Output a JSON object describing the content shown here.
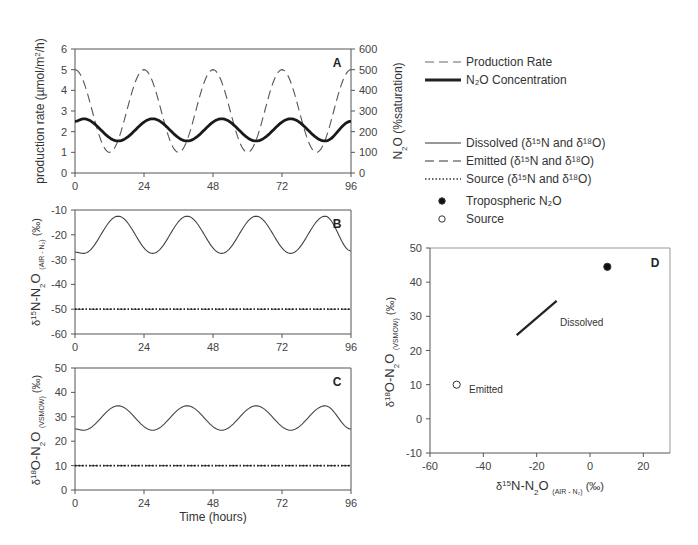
{
  "chart_data": [
    {
      "panel": "A",
      "type": "line",
      "xlabel": "",
      "ylabel": "production rate (µmol/m²/h)",
      "ylabel_right": "N₂O (%saturation)",
      "xlim": [
        0,
        96
      ],
      "ylim": [
        0,
        6
      ],
      "ylim_right": [
        0,
        600
      ],
      "xticks": [
        0,
        24,
        48,
        72,
        96
      ],
      "yticks": [
        0,
        1,
        2,
        3,
        4,
        5,
        6
      ],
      "yticks_right": [
        0,
        100,
        200,
        300,
        400,
        500,
        600
      ],
      "series": [
        {
          "name": "Production Rate",
          "style": "dashed",
          "axis": "left",
          "x": [
            0,
            12,
            24,
            36,
            48,
            60,
            72,
            84,
            96
          ],
          "values": [
            5,
            1,
            5,
            1,
            5,
            1,
            5,
            1,
            5
          ]
        },
        {
          "name": "N2O Concentration",
          "style": "solid-thick",
          "axis": "left",
          "x": [
            0,
            3,
            15,
            27,
            39,
            51,
            63,
            75,
            87,
            96
          ],
          "values": [
            2.5,
            2.62,
            1.55,
            2.62,
            1.55,
            2.62,
            1.55,
            2.62,
            1.55,
            2.5
          ]
        }
      ]
    },
    {
      "panel": "B",
      "type": "line",
      "ylabel": "δ15N-N2O (AIR - N2) (‰)",
      "xlim": [
        0,
        96
      ],
      "ylim": [
        -60,
        -10
      ],
      "xticks": [
        0,
        24,
        48,
        72,
        96
      ],
      "yticks": [
        -60,
        -50,
        -40,
        -30,
        -20,
        -10
      ],
      "series": [
        {
          "name": "Dissolved",
          "style": "solid",
          "x": [
            0,
            3,
            15,
            27,
            39,
            51,
            63,
            75,
            87,
            96
          ],
          "values": [
            -27,
            -27.5,
            -12.5,
            -27.5,
            -12.5,
            -27.5,
            -12.5,
            -27.5,
            -12.5,
            -26.5
          ]
        },
        {
          "name": "Emitted",
          "style": "dashed",
          "x": [
            0,
            96
          ],
          "values": [
            -50,
            -50
          ]
        },
        {
          "name": "Source",
          "style": "dotted",
          "x": [
            0,
            96
          ],
          "values": [
            -50,
            -50
          ]
        }
      ]
    },
    {
      "panel": "C",
      "type": "line",
      "xlabel": "Time (hours)",
      "ylabel": "δ18O-N2O (VSMOW) (‰)",
      "xlim": [
        0,
        96
      ],
      "ylim": [
        0,
        50
      ],
      "xticks": [
        0,
        24,
        48,
        72,
        96
      ],
      "yticks": [
        0,
        10,
        20,
        30,
        40,
        50
      ],
      "series": [
        {
          "name": "Dissolved",
          "style": "solid",
          "x": [
            0,
            3,
            15,
            27,
            39,
            51,
            63,
            75,
            87,
            96
          ],
          "values": [
            25,
            24.5,
            34.5,
            24.5,
            34.5,
            24.5,
            34.5,
            24.5,
            34.5,
            25
          ]
        },
        {
          "name": "Emitted",
          "style": "dashed",
          "x": [
            0,
            96
          ],
          "values": [
            10,
            10
          ]
        },
        {
          "name": "Source",
          "style": "dotted",
          "x": [
            0,
            96
          ],
          "values": [
            10,
            10
          ]
        }
      ]
    },
    {
      "panel": "D",
      "type": "scatter",
      "xlabel": "δ15N-N2O (AIR - N2) (‰)",
      "ylabel": "δ18O-N2O (VSMOW) (‰)",
      "xlim": [
        -60,
        30
      ],
      "ylim": [
        -10,
        50
      ],
      "xticks": [
        -60,
        -40,
        -20,
        0,
        20
      ],
      "yticks": [
        -10,
        0,
        10,
        20,
        30,
        40,
        50
      ],
      "points": [
        {
          "name": "Tropospheric N2O",
          "marker": "filled-circle",
          "x": 6.5,
          "y": 44.5
        },
        {
          "name": "Source",
          "marker": "open-circle",
          "x": -50,
          "y": 10,
          "annotation": "Emitted"
        }
      ],
      "lines": [
        {
          "name": "Dissolved",
          "x": [
            -27.5,
            -12.5
          ],
          "y": [
            24.5,
            34.5
          ],
          "annotation": "Dissolved"
        }
      ]
    }
  ],
  "panels": {
    "A": {
      "label": "A",
      "ylabel": "production rate (µmol/m",
      "ylabel_sup": "2",
      "ylabel_end": "/h)",
      "ylabel_right_main": "N",
      "ylabel_right_sub": "2",
      "ylabel_right_end": "O  (%saturation)",
      "xticks": [
        "0",
        "24",
        "48",
        "72",
        "96"
      ],
      "yticks": [
        "0",
        "1",
        "2",
        "3",
        "4",
        "5",
        "6"
      ],
      "yticks_right": [
        "0",
        "100",
        "200",
        "300",
        "400",
        "500",
        "600"
      ]
    },
    "B": {
      "label": "B",
      "xticks": [
        "0",
        "24",
        "48",
        "72",
        "96"
      ],
      "yticks": [
        "-60",
        "-50",
        "-40",
        "-30",
        "-20",
        "-10"
      ]
    },
    "C": {
      "label": "C",
      "xticks": [
        "0",
        "24",
        "48",
        "72",
        "96"
      ],
      "yticks": [
        "0",
        "10",
        "20",
        "30",
        "40",
        "50"
      ],
      "xlabel": "Time (hours)"
    },
    "D": {
      "label": "D",
      "xticks": [
        "-60",
        "-40",
        "-20",
        "0",
        "20"
      ],
      "yticks": [
        "-10",
        "0",
        "10",
        "20",
        "30",
        "40",
        "50"
      ],
      "ann_dissolved": "Dissolved",
      "ann_emitted": "Emitted"
    }
  },
  "legend": {
    "top": [
      {
        "label": "Production Rate",
        "style": "dashed"
      },
      {
        "label": "N₂O Concentration",
        "style": "solid-thick"
      }
    ],
    "bottom": [
      {
        "label": "Dissolved (δ¹⁵N and δ¹⁸O)",
        "style": "solid"
      },
      {
        "label": "Emitted (δ¹⁵N and δ¹⁸O)",
        "style": "dashed"
      },
      {
        "label": "Source (δ¹⁵N and δ¹⁸O)",
        "style": "dotted"
      },
      {
        "label": "Tropospheric N₂O",
        "style": "filled-circle"
      },
      {
        "label": "Source",
        "style": "open-circle"
      }
    ]
  },
  "colors": {
    "axis": "#555555",
    "line": "#222222",
    "dashed": "#555555"
  }
}
